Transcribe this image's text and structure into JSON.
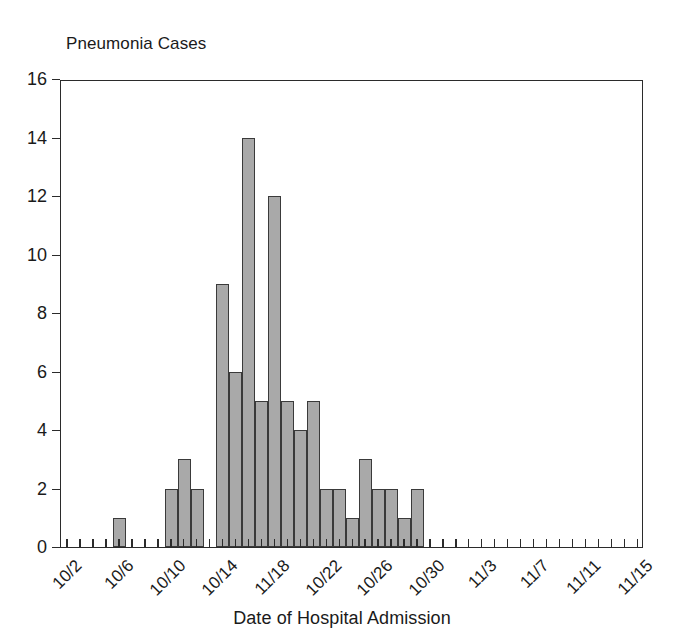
{
  "chart_data": {
    "type": "bar",
    "title": "Pneumonia Cases",
    "xlabel": "Date of Hospital Admission",
    "ylabel": "Pneumonia Cases",
    "ylim": [
      0,
      16
    ],
    "ytick_step": 2,
    "yticks": [
      0,
      2,
      4,
      6,
      8,
      10,
      12,
      14,
      16
    ],
    "grid": false,
    "legend": null,
    "bar_color": "#a9a9a9",
    "bar_edge_color": "#3a3a3a",
    "axis_color": "#2b2b2b",
    "xtick_labels": [
      "10/2",
      "10/6",
      "10/10",
      "10/14",
      "11/18",
      "10/22",
      "10/26",
      "10/30",
      "11/3",
      "11/7",
      "11/11",
      "11/15"
    ],
    "xtick_label_rotation": -45,
    "xtick_every": 4,
    "categories": [
      "10/2",
      "10/3",
      "10/4",
      "10/5",
      "10/6",
      "10/7",
      "10/8",
      "10/9",
      "10/10",
      "10/11",
      "10/12",
      "10/13",
      "10/14",
      "10/15",
      "10/16",
      "10/17",
      "10/18",
      "10/19",
      "10/20",
      "10/21",
      "10/22",
      "10/23",
      "10/24",
      "10/25",
      "10/26",
      "10/27",
      "10/28",
      "10/29",
      "10/30",
      "10/31",
      "11/1",
      "11/2",
      "11/3",
      "11/4",
      "11/5",
      "11/6",
      "11/7",
      "11/8",
      "11/9",
      "11/10",
      "11/11",
      "11/12",
      "11/13",
      "11/14",
      "11/15"
    ],
    "values": [
      0,
      0,
      0,
      0,
      1,
      0,
      0,
      0,
      2,
      3,
      2,
      0,
      9,
      6,
      14,
      5,
      12,
      5,
      4,
      5,
      2,
      2,
      1,
      3,
      2,
      2,
      1,
      2,
      0,
      0,
      0,
      0,
      0,
      0,
      0,
      0,
      0,
      0,
      0,
      0,
      0,
      0,
      0,
      0,
      0
    ]
  }
}
